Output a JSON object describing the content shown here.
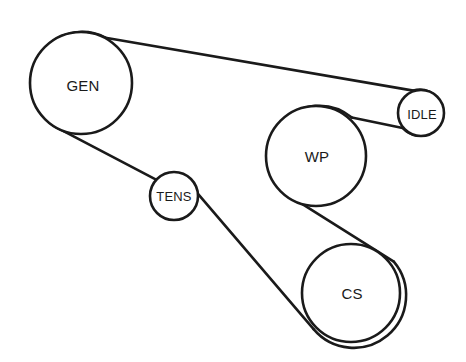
{
  "diagram": {
    "type": "belt-routing",
    "canvas": {
      "width": 466,
      "height": 362
    },
    "colors": {
      "background": "#ffffff",
      "line": "#1a1a1a",
      "label": "#1a1a1a",
      "pulley_fill": "#ffffff"
    },
    "line_width": 2.6,
    "pulleys": [
      {
        "id": "gen",
        "label": "GEN",
        "name": "Generator / Alternator",
        "cx": 81,
        "cy": 83,
        "r": 51,
        "font_size": 15,
        "label_x": 83,
        "label_y": 85
      },
      {
        "id": "idle",
        "label": "IDLE",
        "name": "Idler Pulley",
        "cx": 421,
        "cy": 113,
        "r": 23,
        "font_size": 13,
        "label_x": 422,
        "label_y": 114
      },
      {
        "id": "wp",
        "label": "WP",
        "name": "Water Pump",
        "cx": 316,
        "cy": 156,
        "r": 50,
        "font_size": 15,
        "label_x": 317,
        "label_y": 156
      },
      {
        "id": "tens",
        "label": "TENS",
        "name": "Tensioner",
        "cx": 174,
        "cy": 196,
        "r": 24,
        "font_size": 13,
        "label_x": 174,
        "label_y": 196
      },
      {
        "id": "cs",
        "label": "CS",
        "name": "Crankshaft",
        "cx": 351,
        "cy": 293,
        "r": 49,
        "font_size": 15,
        "label_x": 352,
        "label_y": 293
      }
    ],
    "belt_segments": [
      {
        "id": "gen-to-idle",
        "from": "gen",
        "to": "idle",
        "path": "M 105.5 37.7 L 413.3 90.6"
      },
      {
        "id": "idle-arc",
        "from": "idle",
        "to": "idle",
        "path": "M 413.3 90.6 A 23 23 0 1 1 402.6 128.0"
      },
      {
        "id": "idle-to-wp",
        "from": "idle",
        "to": "wp",
        "path": "M 402.6 128.0 L 351.8 117.6"
      },
      {
        "id": "wp-arc-top",
        "from": "wp",
        "to": "wp",
        "path": "M 351.8 117.6 A 50 50 0 1 0 286.9 194.4"
      },
      {
        "id": "wp-to-cs-cross",
        "from": "wp",
        "to": "cs",
        "path": "M 286.9 194.4 L 393.8 261.7"
      },
      {
        "id": "cs-arc",
        "from": "cs",
        "to": "cs",
        "path": "M 393.8 261.7 A 49 49 0 1 1 313.6 329.2"
      },
      {
        "id": "cs-to-tens",
        "from": "cs",
        "to": "tens",
        "path": "M 313.6 329.2 L 192.0 186.8"
      },
      {
        "id": "tens-arc",
        "from": "tens",
        "to": "tens",
        "path": "M 192.0 186.8 A 24 24 0 0 0 157.5 180.4"
      },
      {
        "id": "tens-to-gen",
        "from": "tens",
        "to": "gen",
        "path": "M 157.5 180.4 L 58.8 128.7"
      },
      {
        "id": "gen-arc",
        "from": "gen",
        "to": "gen",
        "path": "M 58.8 128.7 A 51 51 0 1 1 105.5 37.7"
      }
    ]
  }
}
